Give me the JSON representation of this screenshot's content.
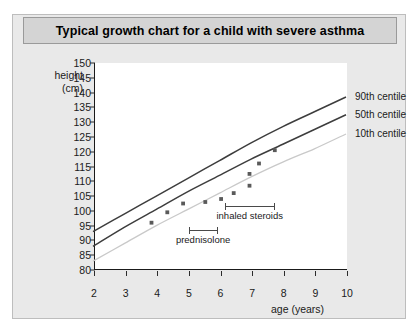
{
  "title": "Typical growth chart for a child with severe asthma",
  "axes": {
    "y_title_line1": "height",
    "y_title_line2": "(cm)",
    "x_title": "age (years)",
    "y_ticks": [
      80,
      85,
      90,
      95,
      100,
      105,
      110,
      115,
      120,
      125,
      130,
      135,
      140,
      145,
      150
    ],
    "x_ticks": [
      2,
      3,
      4,
      5,
      6,
      7,
      8,
      9,
      10
    ]
  },
  "colors": {
    "panel": "#e9e9e9",
    "title_bar": "#d4d4d4",
    "plot_bg": "#ffffff",
    "axis": "#1a1a1a",
    "centile_dark": "#3d3d3d",
    "centile_light": "#c9c9c9",
    "point": "#5a5a5a",
    "annotation": "#4a4a4a"
  },
  "chart_data": {
    "type": "line",
    "title": "Typical growth chart for a child with severe asthma",
    "xlabel": "age (years)",
    "ylabel": "height (cm)",
    "xlim": [
      2,
      10
    ],
    "ylim": [
      80,
      150
    ],
    "grid": false,
    "legend_position": "right-of-curves",
    "series": [
      {
        "name": "90th centile",
        "style": "dark-line",
        "x": [
          2,
          3,
          4,
          5,
          6,
          7,
          8,
          9,
          10
        ],
        "y": [
          93.0,
          99.0,
          105.0,
          111.0,
          117.0,
          123.0,
          128.5,
          133.5,
          138.5
        ]
      },
      {
        "name": "50th centile",
        "style": "dark-line",
        "x": [
          2,
          3,
          4,
          5,
          6,
          7,
          8,
          9,
          10
        ],
        "y": [
          88.0,
          94.5,
          100.5,
          106.5,
          112.0,
          117.5,
          122.5,
          127.5,
          132.5
        ]
      },
      {
        "name": "10th centile",
        "style": "light-line",
        "x": [
          2,
          3,
          4,
          5,
          6,
          7,
          8,
          9,
          10
        ],
        "y": [
          83.0,
          89.0,
          95.0,
          100.5,
          106.0,
          111.5,
          116.5,
          121.0,
          126.0
        ]
      },
      {
        "name": "child measurements",
        "style": "scatter",
        "points": [
          {
            "x": 3.85,
            "y": 96.0
          },
          {
            "x": 4.35,
            "y": 99.5
          },
          {
            "x": 4.85,
            "y": 102.5
          },
          {
            "x": 5.55,
            "y": 103.0
          },
          {
            "x": 6.05,
            "y": 104.0
          },
          {
            "x": 6.45,
            "y": 106.0
          },
          {
            "x": 6.95,
            "y": 108.5
          },
          {
            "x": 6.95,
            "y": 112.5
          },
          {
            "x": 7.25,
            "y": 116.0
          },
          {
            "x": 7.75,
            "y": 120.5
          }
        ]
      }
    ],
    "annotations": [
      {
        "label": "prednisolone",
        "x_start": 5.0,
        "x_end": 5.9,
        "y": 93.5
      },
      {
        "label": "inhaled steroids",
        "x_start": 6.15,
        "x_end": 7.7,
        "y": 101.5
      }
    ]
  }
}
